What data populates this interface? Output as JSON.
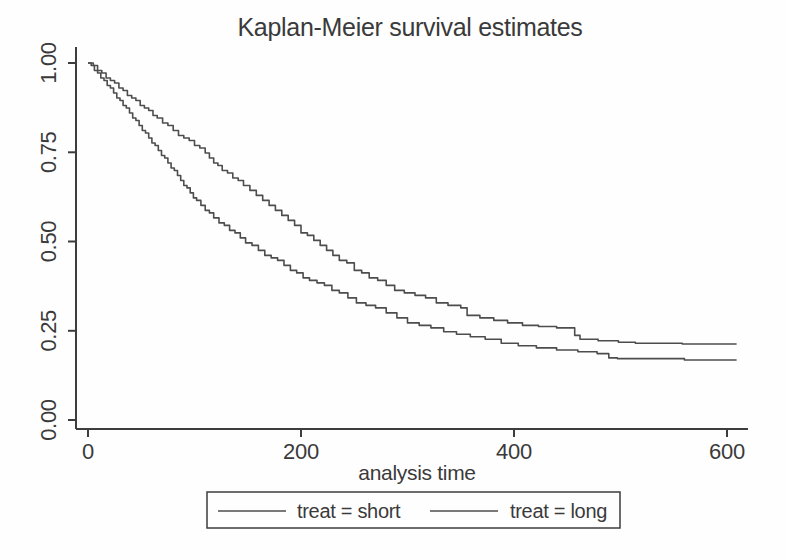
{
  "figure": {
    "background": "#fefefe",
    "ink_color": "#3a3a3a",
    "curve_color": "#4d4d4d"
  },
  "chart_data": {
    "type": "line",
    "subtype": "kaplan-meier-step",
    "title": "Kaplan-Meier survival estimates",
    "xlabel": "analysis time",
    "ylabel": "",
    "xlim": [
      0,
      630
    ],
    "ylim": [
      0.0,
      1.0
    ],
    "grid": false,
    "legend_position": "bottom",
    "x_ticks": [
      0,
      200,
      400,
      600
    ],
    "x_tick_labels": [
      "0",
      "200",
      "400",
      "600"
    ],
    "y_ticks": [
      0.0,
      0.25,
      0.5,
      0.75,
      1.0
    ],
    "y_tick_labels": [
      "0.00",
      "0.25",
      "0.50",
      "0.75",
      "1.00"
    ],
    "series": [
      {
        "name": "treat = short",
        "final_value": 0.168,
        "points": [
          [
            0,
            1.0
          ],
          [
            3,
            0.993
          ],
          [
            6,
            0.979
          ],
          [
            9,
            0.972
          ],
          [
            12,
            0.958
          ],
          [
            15,
            0.951
          ],
          [
            18,
            0.937
          ],
          [
            21,
            0.93
          ],
          [
            24,
            0.916
          ],
          [
            27,
            0.902
          ],
          [
            30,
            0.895
          ],
          [
            33,
            0.881
          ],
          [
            36,
            0.874
          ],
          [
            39,
            0.86
          ],
          [
            42,
            0.846
          ],
          [
            45,
            0.839
          ],
          [
            48,
            0.825
          ],
          [
            51,
            0.811
          ],
          [
            54,
            0.804
          ],
          [
            57,
            0.79
          ],
          [
            60,
            0.776
          ],
          [
            63,
            0.769
          ],
          [
            66,
            0.755
          ],
          [
            69,
            0.741
          ],
          [
            72,
            0.734
          ],
          [
            75,
            0.72
          ],
          [
            78,
            0.706
          ],
          [
            81,
            0.699
          ],
          [
            84,
            0.685
          ],
          [
            87,
            0.671
          ],
          [
            90,
            0.657
          ],
          [
            93,
            0.65
          ],
          [
            96,
            0.636
          ],
          [
            99,
            0.622
          ],
          [
            102,
            0.615
          ],
          [
            106,
            0.601
          ],
          [
            110,
            0.587
          ],
          [
            114,
            0.58
          ],
          [
            118,
            0.566
          ],
          [
            123,
            0.552
          ],
          [
            128,
            0.545
          ],
          [
            133,
            0.531
          ],
          [
            138,
            0.524
          ],
          [
            143,
            0.51
          ],
          [
            148,
            0.496
          ],
          [
            154,
            0.489
          ],
          [
            160,
            0.475
          ],
          [
            166,
            0.461
          ],
          [
            172,
            0.454
          ],
          [
            178,
            0.447
          ],
          [
            184,
            0.433
          ],
          [
            190,
            0.419
          ],
          [
            196,
            0.412
          ],
          [
            202,
            0.398
          ],
          [
            208,
            0.391
          ],
          [
            215,
            0.384
          ],
          [
            222,
            0.377
          ],
          [
            229,
            0.363
          ],
          [
            236,
            0.356
          ],
          [
            244,
            0.342
          ],
          [
            252,
            0.328
          ],
          [
            261,
            0.321
          ],
          [
            270,
            0.314
          ],
          [
            280,
            0.3
          ],
          [
            290,
            0.286
          ],
          [
            300,
            0.272
          ],
          [
            311,
            0.265
          ],
          [
            322,
            0.258
          ],
          [
            334,
            0.247
          ],
          [
            346,
            0.24
          ],
          [
            359,
            0.233
          ],
          [
            373,
            0.226
          ],
          [
            388,
            0.215
          ],
          [
            404,
            0.208
          ],
          [
            421,
            0.202
          ],
          [
            440,
            0.196
          ],
          [
            460,
            0.191
          ],
          [
            478,
            0.186
          ],
          [
            489,
            0.174
          ],
          [
            497,
            0.172
          ],
          [
            560,
            0.168
          ],
          [
            609,
            0.168
          ]
        ]
      },
      {
        "name": "treat = long",
        "final_value": 0.213,
        "points": [
          [
            0,
            1.0
          ],
          [
            5,
            0.993
          ],
          [
            9,
            0.979
          ],
          [
            13,
            0.972
          ],
          [
            17,
            0.958
          ],
          [
            21,
            0.951
          ],
          [
            25,
            0.944
          ],
          [
            29,
            0.93
          ],
          [
            33,
            0.923
          ],
          [
            37,
            0.909
          ],
          [
            41,
            0.902
          ],
          [
            45,
            0.895
          ],
          [
            49,
            0.881
          ],
          [
            53,
            0.874
          ],
          [
            57,
            0.867
          ],
          [
            61,
            0.853
          ],
          [
            65,
            0.846
          ],
          [
            70,
            0.832
          ],
          [
            75,
            0.825
          ],
          [
            80,
            0.811
          ],
          [
            85,
            0.797
          ],
          [
            90,
            0.79
          ],
          [
            95,
            0.783
          ],
          [
            100,
            0.769
          ],
          [
            105,
            0.762
          ],
          [
            110,
            0.748
          ],
          [
            114,
            0.734
          ],
          [
            118,
            0.72
          ],
          [
            122,
            0.713
          ],
          [
            126,
            0.699
          ],
          [
            131,
            0.692
          ],
          [
            136,
            0.678
          ],
          [
            141,
            0.671
          ],
          [
            146,
            0.657
          ],
          [
            152,
            0.643
          ],
          [
            158,
            0.629
          ],
          [
            164,
            0.615
          ],
          [
            170,
            0.601
          ],
          [
            176,
            0.587
          ],
          [
            182,
            0.573
          ],
          [
            188,
            0.559
          ],
          [
            194,
            0.545
          ],
          [
            200,
            0.524
          ],
          [
            206,
            0.517
          ],
          [
            212,
            0.503
          ],
          [
            218,
            0.489
          ],
          [
            224,
            0.475
          ],
          [
            230,
            0.461
          ],
          [
            236,
            0.447
          ],
          [
            243,
            0.44
          ],
          [
            250,
            0.419
          ],
          [
            257,
            0.412
          ],
          [
            264,
            0.398
          ],
          [
            272,
            0.391
          ],
          [
            280,
            0.377
          ],
          [
            288,
            0.363
          ],
          [
            297,
            0.356
          ],
          [
            307,
            0.349
          ],
          [
            317,
            0.342
          ],
          [
            327,
            0.328
          ],
          [
            338,
            0.321
          ],
          [
            350,
            0.314
          ],
          [
            356,
            0.293
          ],
          [
            368,
            0.286
          ],
          [
            381,
            0.279
          ],
          [
            394,
            0.272
          ],
          [
            408,
            0.265
          ],
          [
            423,
            0.262
          ],
          [
            440,
            0.258
          ],
          [
            457,
            0.237
          ],
          [
            462,
            0.226
          ],
          [
            479,
            0.222
          ],
          [
            498,
            0.218
          ],
          [
            514,
            0.215
          ],
          [
            558,
            0.213
          ],
          [
            609,
            0.213
          ]
        ]
      }
    ]
  }
}
